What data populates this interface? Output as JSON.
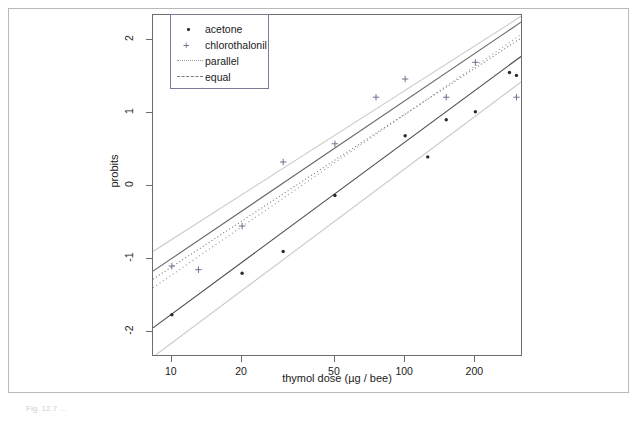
{
  "figure": {
    "caption": "Fig. 12.7 …"
  },
  "chart_data": {
    "type": "scatter",
    "title": "",
    "xlabel": "thymol dose (µg / bee)",
    "ylabel": "probits",
    "xscale": "log",
    "xlim": [
      8.3,
      320
    ],
    "ylim": [
      -2.35,
      2.35
    ],
    "grid": false,
    "xticks": [
      10,
      20,
      50,
      100,
      200
    ],
    "xtick_labels": [
      "10",
      "20",
      "50",
      "100",
      "200"
    ],
    "yticks": [
      2,
      1,
      0,
      -1,
      -2
    ],
    "ytick_labels": [
      "2",
      "1",
      "0",
      "-1",
      "-2"
    ],
    "legend_position": "top-left",
    "legend": [
      {
        "label": "acetone",
        "marker": "dot",
        "color": "#2b2b2b"
      },
      {
        "label": "chlorothalonil",
        "marker": "plus",
        "color": "#6f6f8a"
      },
      {
        "label": "parallel",
        "marker": "dotted-line",
        "color": "#9a9a9a"
      },
      {
        "label": "equal",
        "marker": "dashdot-line",
        "color": "#7a7a7a"
      }
    ],
    "series": [
      {
        "name": "acetone",
        "marker": "dot",
        "color": "#2b2b2b",
        "points": [
          {
            "x": 10,
            "y": -1.77
          },
          {
            "x": 20,
            "y": -1.2
          },
          {
            "x": 30,
            "y": -0.9
          },
          {
            "x": 50,
            "y": -0.13
          },
          {
            "x": 100,
            "y": 0.69
          },
          {
            "x": 125,
            "y": 0.4
          },
          {
            "x": 150,
            "y": 0.91
          },
          {
            "x": 200,
            "y": 1.02
          },
          {
            "x": 280,
            "y": 1.56
          },
          {
            "x": 300,
            "y": 1.52
          }
        ]
      },
      {
        "name": "chlorothalonil",
        "marker": "plus",
        "color": "#6f6f8a",
        "points": [
          {
            "x": 10,
            "y": -1.1
          },
          {
            "x": 13,
            "y": -1.15
          },
          {
            "x": 20,
            "y": -0.55
          },
          {
            "x": 30,
            "y": 0.33
          },
          {
            "x": 50,
            "y": 0.58
          },
          {
            "x": 75,
            "y": 1.22
          },
          {
            "x": 100,
            "y": 1.47
          },
          {
            "x": 150,
            "y": 1.22
          },
          {
            "x": 200,
            "y": 1.7
          },
          {
            "x": 300,
            "y": 1.22
          }
        ]
      }
    ],
    "fit_lines": [
      {
        "name": "acetone-fit",
        "style": "solid",
        "color": "#4a4a4a",
        "x": [
          8.3,
          320
        ],
        "y": [
          -1.95,
          1.8
        ]
      },
      {
        "name": "chlorothalonil-fit",
        "style": "solid",
        "color": "#6a6a6a",
        "x": [
          8.3,
          320
        ],
        "y": [
          -1.17,
          2.27
        ]
      },
      {
        "name": "parallel",
        "style": "dotted",
        "color": "#9a9a9a",
        "x": [
          8.3,
          320
        ],
        "y": [
          -1.4,
          2.1
        ]
      },
      {
        "name": "equal",
        "style": "dashdot",
        "color": "#7a7a7a",
        "x": [
          8.3,
          320
        ],
        "y": [
          -1.28,
          2.05
        ]
      },
      {
        "name": "confidence-upper-outer",
        "style": "solid",
        "color": "#cbcbcb",
        "x": [
          8.3,
          320
        ],
        "y": [
          -0.9,
          2.35
        ]
      },
      {
        "name": "confidence-lower-outer",
        "style": "solid",
        "color": "#cbcbcb",
        "x": [
          8.3,
          320
        ],
        "y": [
          -2.35,
          1.45
        ]
      }
    ]
  }
}
